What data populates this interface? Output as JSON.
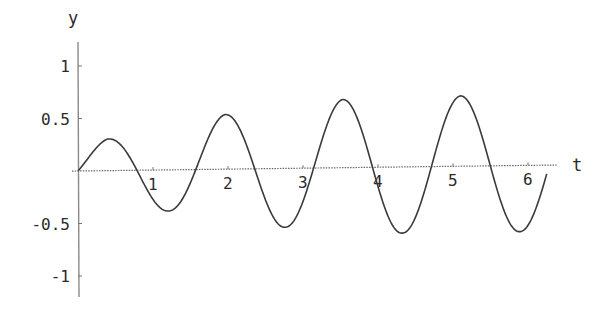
{
  "chart_data": {
    "type": "line",
    "title": "",
    "xlabel": "t",
    "ylabel": "y",
    "xlim": [
      0,
      6.4
    ],
    "ylim": [
      -1.2,
      1.2
    ],
    "grid": false,
    "legend": null,
    "x_ticks": [
      1,
      2,
      3,
      4,
      5,
      6
    ],
    "x_tick_labels": [
      "1",
      "2",
      "3",
      "4",
      "5",
      "6"
    ],
    "y_ticks": [
      1,
      0.5,
      -0.5,
      -1
    ],
    "y_tick_labels": [
      "1",
      "0.5",
      "-0.5",
      "-1"
    ],
    "series": [
      {
        "name": "y(t)",
        "color": "#3a3a3a",
        "x": [
          0,
          0.39,
          0.785,
          1.18,
          1.57,
          1.96,
          2.36,
          2.75,
          3.14,
          3.53,
          3.93,
          4.32,
          4.71,
          5.1,
          5.5,
          5.89,
          6.25
        ],
        "y": [
          0,
          0.3,
          0,
          -0.39,
          0,
          0.52,
          0,
          -0.56,
          0,
          0.65,
          0,
          -0.63,
          0,
          0.67,
          0,
          -0.63,
          -0.08
        ]
      }
    ],
    "amplitude_envelope": {
      "t": [
        0,
        0.39,
        1.18,
        1.96,
        2.75,
        3.53,
        4.32,
        5.1,
        5.89,
        6.25
      ],
      "a": [
        0.2,
        0.3,
        0.39,
        0.52,
        0.56,
        0.65,
        0.63,
        0.67,
        0.63,
        0.63
      ]
    },
    "angular_frequency": 4
  },
  "labels": {
    "x_axis": "t",
    "y_axis": "y"
  }
}
